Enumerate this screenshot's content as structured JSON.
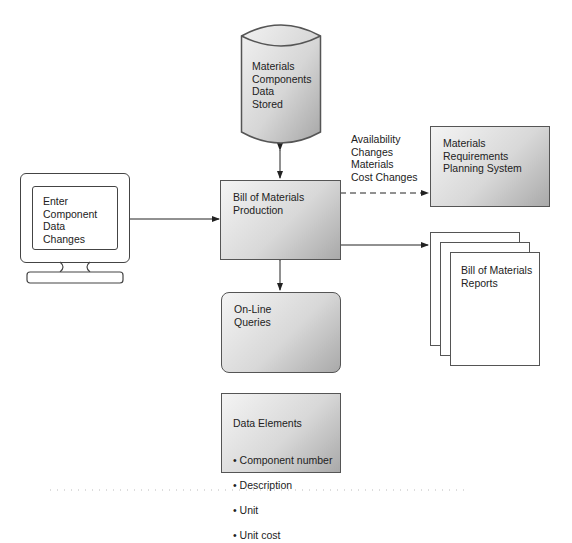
{
  "diagram": {
    "nodes": {
      "database": {
        "label": "Materials\nComponents\nData\nStored",
        "shape": "cylinder"
      },
      "terminal": {
        "label": "Enter\nComponent\nData\nChanges",
        "shape": "monitor"
      },
      "bom_production": {
        "label": "Bill of Materials\nProduction",
        "shape": "rectangle"
      },
      "mrp_system": {
        "label": "Materials\nRequirements\nPlanning System",
        "shape": "rectangle"
      },
      "reports": {
        "label": "Bill of Materials\nReports",
        "shape": "document-stack"
      },
      "online_queries": {
        "label": "On-Line\nQueries",
        "shape": "rounded-rectangle"
      },
      "data_elements": {
        "title": "Data Elements",
        "items": [
          "Component number",
          "Description",
          "Unit",
          "Unit cost"
        ]
      }
    },
    "edges": [
      {
        "from": "database",
        "to": "bom_production",
        "style": "solid",
        "direction": "both"
      },
      {
        "from": "terminal",
        "to": "bom_production",
        "style": "solid",
        "direction": "forward"
      },
      {
        "from": "bom_production",
        "to": "mrp_system",
        "style": "dashed",
        "direction": "forward",
        "label": "Availability\nChanges\nMaterials\nCost Changes"
      },
      {
        "from": "bom_production",
        "to": "reports",
        "style": "solid",
        "direction": "forward"
      },
      {
        "from": "bom_production",
        "to": "online_queries",
        "style": "solid",
        "direction": "both"
      }
    ]
  }
}
